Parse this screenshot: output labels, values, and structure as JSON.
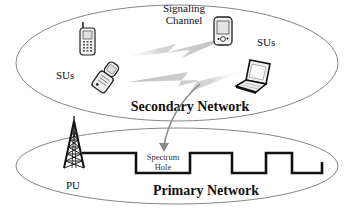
{
  "diagram": {
    "secondary_network": {
      "label": "Secondary Network",
      "su_label_left": "SUs",
      "su_label_right": "SUs",
      "signaling_line1": "Signaling",
      "signaling_line2": "Channel",
      "devices": [
        "cell-phone",
        "flip-phone",
        "pda",
        "laptop"
      ]
    },
    "primary_network": {
      "label": "Primary Network",
      "pu_label": "PU",
      "spectrum_hole_line1": "Spectrum",
      "spectrum_hole_line2": "Hole"
    },
    "colors": {
      "outline": "#555555",
      "waveform": "#111111",
      "lightning": "#c8c8c8",
      "arrow": "#8a8a8a"
    }
  }
}
